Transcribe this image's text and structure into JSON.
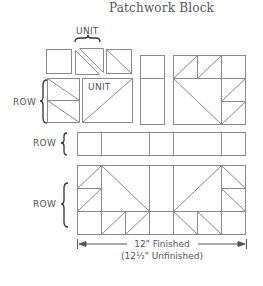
{
  "title": "Patchwork Block",
  "labels": {
    "unit_top": "UNIT",
    "unit_inner": "UNIT",
    "row_top": "ROW",
    "row_middle": "ROW",
    "row_bottom": "ROW"
  },
  "dimensions": {
    "finished": "12\" Finished",
    "unfinished": "(12½\" Unfinished)"
  },
  "colors": {
    "line": "#8a8a8a",
    "text": "#555555",
    "brace": "#333333"
  }
}
